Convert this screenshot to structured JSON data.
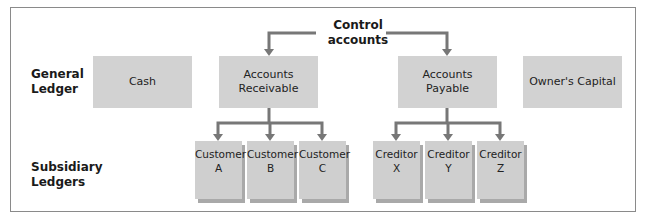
{
  "diagram": {
    "control_label": [
      "Control",
      "accounts"
    ],
    "rows": {
      "general": [
        "General",
        "Ledger"
      ],
      "subsidiary": [
        "Subsidiary",
        "Ledgers"
      ]
    },
    "general_ledger": [
      {
        "label": [
          "Cash"
        ]
      },
      {
        "label": [
          "Accounts",
          "Receivable"
        ]
      },
      {
        "label": [
          "Accounts",
          "Payable"
        ]
      },
      {
        "label": [
          "Owner's Capital"
        ]
      }
    ],
    "subsidiary_ledgers": {
      "receivable": [
        {
          "label": [
            "Customer",
            "A"
          ]
        },
        {
          "label": [
            "Customer",
            "B"
          ]
        },
        {
          "label": [
            "Customer",
            "C"
          ]
        }
      ],
      "payable": [
        {
          "label": [
            "Creditor",
            "X"
          ]
        },
        {
          "label": [
            "Creditor",
            "Y"
          ]
        },
        {
          "label": [
            "Creditor",
            "Z"
          ]
        }
      ]
    },
    "colors": {
      "box": "#d2d2d2",
      "line": "#777777",
      "border": "#8a8a8a"
    }
  }
}
